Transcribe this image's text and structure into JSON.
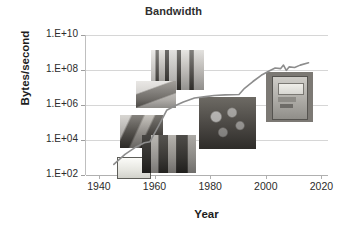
{
  "chart_data": {
    "type": "line",
    "title": "Bandwidth",
    "xlabel": "Year",
    "ylabel": "Bytes/second",
    "xlim": [
      1935,
      2022
    ],
    "ylim": [
      100,
      10000000000
    ],
    "yscale": "log",
    "grid": true,
    "legend": "none",
    "xticks": [
      "1940",
      "1960",
      "1980",
      "2000",
      "2020"
    ],
    "xtick_values": [
      1940,
      1960,
      1980,
      2000,
      2020
    ],
    "yticks": [
      "1.E+02",
      "1.E+04",
      "1.E+06",
      "1.E+08",
      "1.E+10"
    ],
    "ytick_values": [
      100,
      10000,
      1000000,
      100000000,
      10000000000
    ],
    "series": [
      {
        "name": "Bandwidth",
        "color": "#8d8d8d",
        "x": [
          1945,
          1949,
          1953,
          1956,
          1958,
          1961,
          1964,
          1967,
          1970,
          1974,
          1978,
          1981,
          1985,
          1990,
          1992,
          1995,
          1998,
          2001,
          2003,
          2005,
          2006,
          2007,
          2008,
          2010,
          2012,
          2015
        ],
        "y": [
          400,
          1500,
          4000,
          7000,
          8000,
          60000,
          500000,
          900000,
          1500000,
          2500000,
          3000000,
          3500000,
          3800000,
          4000000,
          9000000,
          22000000,
          50000000,
          90000000,
          130000000,
          120000000,
          190000000,
          95000000,
          150000000,
          140000000,
          190000000,
          260000000
        ]
      }
    ],
    "annotations": [
      {
        "name": "early-computer-console-photo",
        "label": "early computer console",
        "x_year": 1955,
        "y_value": 30000
      },
      {
        "name": "circuit-boards-photo",
        "label": "circuit boards",
        "x_year": 1968,
        "y_value": 100000000
      },
      {
        "name": "lab-desk-photo",
        "label": "lab desk equipment",
        "x_year": 1960,
        "y_value": 4000000
      },
      {
        "name": "blank-screen-photo",
        "label": "blank display panel",
        "x_year": 1952,
        "y_value": 300
      },
      {
        "name": "mainframe-cabinet-photo",
        "label": "mainframe cabinet",
        "x_year": 1965,
        "y_value": 1500
      },
      {
        "name": "machine-room-photo",
        "label": "machine room",
        "x_year": 1986,
        "y_value": 90000
      },
      {
        "name": "hard-disk-drive-photo",
        "label": "hard disk drive",
        "x_year": 2008,
        "y_value": 3000000
      }
    ]
  },
  "style": {
    "title_color": "#2f2f2f",
    "axis_text_color": "#2b2b2b",
    "grid_color": "#d6d6d6",
    "line_color": "#8d8d8d",
    "background": "#ffffff"
  }
}
